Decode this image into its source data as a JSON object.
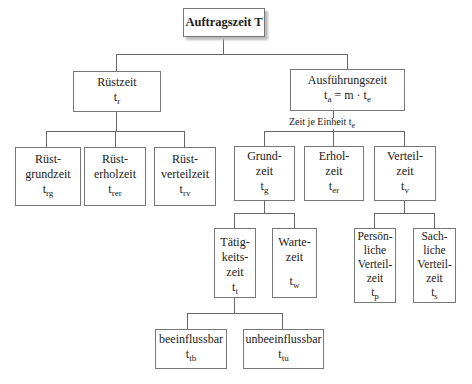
{
  "diagram": {
    "root": {
      "label": "Auftragszeit T"
    },
    "setup": {
      "label": "Rüstzeit",
      "symbol": "t",
      "sub": "r",
      "children": [
        {
          "line1": "Rüst-",
          "line2": "grundzeit",
          "symbol": "t",
          "sub": "rg"
        },
        {
          "line1": "Rüst-",
          "line2": "erholzeit",
          "symbol": "t",
          "sub": "rer"
        },
        {
          "line1": "Rüst-",
          "line2": "verteilzeit",
          "symbol": "t",
          "sub": "rv"
        }
      ]
    },
    "execution": {
      "label": "Ausführungszeit",
      "formula_t": "t",
      "formula_sub_a": "a",
      "formula_mid": " = m · t",
      "formula_sub_e": "e",
      "per_unit_label": "Zeit je Einheit t",
      "per_unit_sub": "e",
      "children": [
        {
          "line1": "Grund-",
          "line2": "zeit",
          "symbol": "t",
          "sub": "g"
        },
        {
          "line1": "Erhol-",
          "line2": "zeit",
          "symbol": "t",
          "sub": "er"
        },
        {
          "line1": "Verteil-",
          "line2": "zeit",
          "symbol": "t",
          "sub": "v"
        }
      ]
    },
    "basic_time_children": [
      {
        "line1": "Tätig-",
        "line2": "keits-",
        "line3": "zeit",
        "symbol": "t",
        "sub": "t"
      },
      {
        "line1": "Warte-",
        "line2": "zeit",
        "symbol": "t",
        "sub": "w"
      }
    ],
    "allowance_children": [
      {
        "line1": "Persön-",
        "line2": "liche",
        "line3": "Verteil-",
        "line4": "zeit",
        "symbol": "t",
        "sub": "p"
      },
      {
        "line1": "Sach-",
        "line2": "liche",
        "line3": "Verteil-",
        "line4": "zeit",
        "symbol": "t",
        "sub": "s"
      }
    ],
    "activity_children": [
      {
        "label": "beeinflussbar",
        "symbol": "t",
        "sub": "tb"
      },
      {
        "label": "unbeeinflussbar",
        "symbol": "t",
        "sub": "tu"
      }
    ]
  }
}
